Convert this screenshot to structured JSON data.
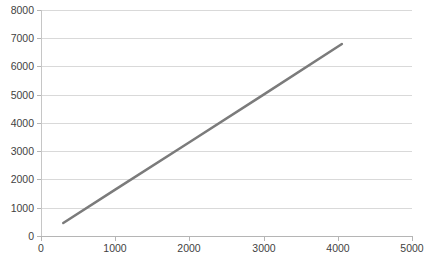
{
  "chart_data": {
    "type": "line",
    "title": "",
    "subtitle": "",
    "xlabel": "",
    "ylabel": "",
    "xlim": [
      0,
      5000
    ],
    "ylim": [
      0,
      8000
    ],
    "grid": true,
    "grid_axis": "y",
    "legend": false,
    "legend_position": "none",
    "x_ticks": [
      0,
      1000,
      2000,
      3000,
      4000,
      5000
    ],
    "x_tick_labels": [
      "0",
      "1000",
      "2000",
      "3000",
      "4000",
      "5000"
    ],
    "y_ticks": [
      0,
      1000,
      2000,
      3000,
      4000,
      5000,
      6000,
      7000,
      8000
    ],
    "y_tick_labels": [
      "0",
      "1000",
      "2000",
      "3000",
      "4000",
      "5000",
      "6000",
      "7000",
      "8000"
    ],
    "series": [
      {
        "name": "series-1",
        "color": "#7b7b7b",
        "line_width": 2.5,
        "markers": false,
        "x": [
          300,
          4055
        ],
        "values": [
          460,
          6795
        ],
        "points": [
          {
            "x": 300,
            "y": 460
          },
          {
            "x": 1000,
            "y": 1640
          },
          {
            "x": 2000,
            "y": 3320
          },
          {
            "x": 3000,
            "y": 5005
          },
          {
            "x": 4055,
            "y": 6795
          }
        ]
      }
    ],
    "colors": {
      "series_line": "#7b7b7b",
      "gridline": "#d9d9d9",
      "axis_line": "#b5b5b5",
      "tick_label": "#3f3f3f",
      "plot_background": "#ffffff"
    }
  }
}
